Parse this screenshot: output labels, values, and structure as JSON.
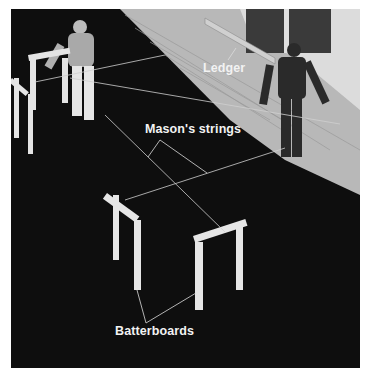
{
  "figure": {
    "labels": {
      "ledger": "Ledger",
      "masons_strings": "Mason's strings",
      "batterboards": "Batterboards"
    },
    "colors": {
      "ground": "#0a0a0a",
      "wall": "#bdbdbd",
      "wood": "#e6e6e6",
      "string": "#d0d0d0",
      "label_text": "#f2f2f2",
      "border": "#ffffff"
    }
  }
}
